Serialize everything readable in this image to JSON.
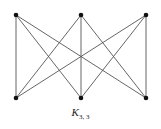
{
  "diagram": {
    "title": "K",
    "subscript": "3, 3",
    "type": "complete bipartite graph",
    "nodes": [
      {
        "id": "a1",
        "x": 16,
        "y": 15,
        "group": "top"
      },
      {
        "id": "a2",
        "x": 81,
        "y": 15,
        "group": "top"
      },
      {
        "id": "a3",
        "x": 146,
        "y": 15,
        "group": "top"
      },
      {
        "id": "b1",
        "x": 16,
        "y": 98,
        "group": "bottom"
      },
      {
        "id": "b2",
        "x": 81,
        "y": 98,
        "group": "bottom"
      },
      {
        "id": "b3",
        "x": 146,
        "y": 98,
        "group": "bottom"
      }
    ],
    "edges": [
      [
        "a1",
        "b1"
      ],
      [
        "a1",
        "b2"
      ],
      [
        "a1",
        "b3"
      ],
      [
        "a2",
        "b1"
      ],
      [
        "a2",
        "b2"
      ],
      [
        "a2",
        "b3"
      ],
      [
        "a3",
        "b1"
      ],
      [
        "a3",
        "b2"
      ],
      [
        "a3",
        "b3"
      ]
    ],
    "colors": {
      "edge": "#555555",
      "node": "#111111"
    }
  }
}
